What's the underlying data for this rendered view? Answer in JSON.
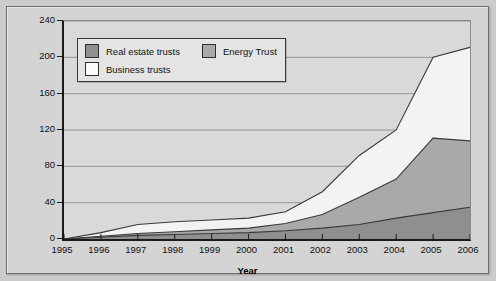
{
  "chart_data": {
    "type": "area",
    "stacked": true,
    "title": "",
    "xlabel": "Year",
    "ylabel": "Market Capitalization ($ billions)",
    "categories": [
      "1995",
      "1996",
      "1997",
      "1998",
      "1999",
      "2000",
      "2001",
      "2002",
      "2003",
      "2004",
      "2005",
      "2006"
    ],
    "x": [
      1995,
      1996,
      1997,
      1998,
      1999,
      2000,
      2001,
      2002,
      2003,
      2004,
      2005,
      2006
    ],
    "xlim": [
      1995,
      2006
    ],
    "ylim": [
      0,
      240
    ],
    "yticks": [
      0,
      40,
      80,
      120,
      160,
      200,
      240
    ],
    "grid": true,
    "legend_position": "top-left",
    "series": [
      {
        "name": "Real estate trusts",
        "color": "#8f8f8f",
        "values": [
          0,
          2,
          4,
          5,
          6,
          7,
          9,
          12,
          16,
          23,
          29,
          35
        ]
      },
      {
        "name": "Energy Trust",
        "color": "#a9a9a9",
        "values": [
          0,
          1,
          2,
          3,
          4,
          5,
          8,
          15,
          30,
          43,
          82,
          73
        ]
      },
      {
        "name": "Business trusts",
        "color": "#f3f3f3",
        "values": [
          0,
          4,
          10,
          11,
          11,
          11,
          13,
          25,
          46,
          54,
          89,
          103
        ]
      }
    ],
    "cumulative_totals": [
      0,
      7,
      16,
      19,
      21,
      23,
      30,
      52,
      92,
      120,
      200,
      211
    ]
  },
  "legend": {
    "items": [
      {
        "label": "Real estate trusts",
        "color": "#8f8f8f"
      },
      {
        "label": "Energy Trust",
        "color": "#a9a9a9"
      },
      {
        "label": "Business trusts",
        "color": "#fbfbfb"
      }
    ]
  },
  "axes": {
    "y_label": "Market Capitalization ($ billions)",
    "x_label": "Year",
    "y_ticks": [
      "240",
      "200",
      "160",
      "120",
      "80",
      "40",
      "0"
    ],
    "x_ticks": [
      "1995",
      "1996",
      "1997",
      "1998",
      "1999",
      "2000",
      "2001",
      "2002",
      "2003",
      "2004",
      "2005",
      "2006"
    ]
  }
}
